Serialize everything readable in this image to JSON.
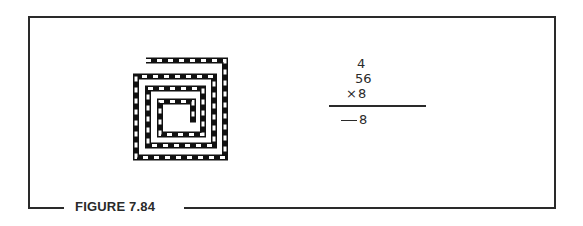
{
  "figure": {
    "caption": "FIGURE 7.84",
    "frame_color": "#2a2a2a",
    "background": "#ffffff"
  },
  "spiral": {
    "description": "square spiral drawn as a dashed black-and-white track",
    "stroke_color": "#111111",
    "dash_color": "#ffffff"
  },
  "math_problem": {
    "carry": "4",
    "multiplicand": "56",
    "operator": "×",
    "multiplier": "8",
    "blank": "__",
    "partial_answer": "8"
  }
}
